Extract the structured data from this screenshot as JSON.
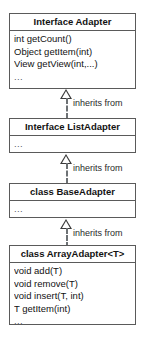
{
  "diagram": {
    "type": "uml-class-diagram",
    "background_color": "#ffffff",
    "border_color": "#5a5a5a",
    "text_color": "#121212",
    "connector_color": "#6d7174",
    "relationship_label": "inherits from",
    "ellipsis": "...",
    "classes": [
      {
        "name": "Interface Adapter",
        "stereotype": "Interface",
        "members": [
          "int getCount()",
          "Object getItem(int)",
          "View getView(int,...)"
        ],
        "has_ellipsis": true
      },
      {
        "name": "Interface ListAdapter",
        "stereotype": "Interface",
        "members": [],
        "has_ellipsis": true
      },
      {
        "name": "class BaseAdapter",
        "stereotype": "class",
        "members": [],
        "has_ellipsis": true
      },
      {
        "name": "class ArrayAdapter<T>",
        "stereotype": "class",
        "members": [
          "void add(T)",
          "void remove(T)",
          "void insert(T, int)",
          "T getItem(int)"
        ],
        "has_ellipsis": true
      }
    ],
    "relationships": [
      {
        "from": "Interface ListAdapter",
        "to": "Interface Adapter",
        "label": "inherits from",
        "style": "dashed",
        "arrow": "hollow-triangle"
      },
      {
        "from": "class BaseAdapter",
        "to": "Interface ListAdapter",
        "label": "inherits from",
        "style": "dashed",
        "arrow": "hollow-triangle"
      },
      {
        "from": "class ArrayAdapter<T>",
        "to": "class BaseAdapter",
        "label": "inherits from",
        "style": "dashed",
        "arrow": "hollow-triangle"
      }
    ]
  }
}
